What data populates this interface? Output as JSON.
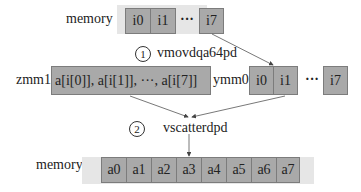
{
  "top_memory": {
    "label": "memory",
    "cells": [
      "i0",
      "i1",
      "i7"
    ],
    "ellipsis": "···"
  },
  "step1": {
    "number": "1",
    "instruction": "vmovdqa64pd"
  },
  "zmm1": {
    "label": "zmm1",
    "content": "a[i[0]],  a[i[1]],  ···,  a[i[7]]"
  },
  "ymm0": {
    "label": "ymm0",
    "cells": [
      "i0",
      "i1",
      "i7"
    ],
    "ellipsis": "···"
  },
  "step2": {
    "number": "2",
    "instruction": "vscatterdpd"
  },
  "bottom_memory": {
    "label": "memory",
    "cells": [
      "a0",
      "a1",
      "a2",
      "a3",
      "a4",
      "a5",
      "a6",
      "a7"
    ]
  },
  "colors": {
    "cell_fill": "#a9a9a9",
    "cell_border": "#7c7c7c",
    "strip_fill": "#e6e6e6",
    "arrow": "#444444"
  }
}
